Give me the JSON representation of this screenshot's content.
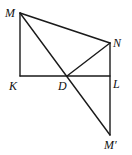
{
  "diagram": {
    "type": "geometry",
    "stroke_color": "#1a1a1a",
    "points": {
      "M": {
        "label": "M",
        "x": 20,
        "y": 13
      },
      "N": {
        "label": "N",
        "x": 110,
        "y": 43
      },
      "K": {
        "label": "K",
        "x": 20,
        "y": 76
      },
      "D": {
        "label": "D",
        "x": 67,
        "y": 76
      },
      "L": {
        "label": "L",
        "x": 110,
        "y": 76
      },
      "Mp": {
        "label": "M′",
        "x": 110,
        "y": 135
      }
    },
    "segments": [
      [
        "M",
        "K"
      ],
      [
        "K",
        "L"
      ],
      [
        "M",
        "N"
      ],
      [
        "N",
        "Mp"
      ],
      [
        "M",
        "Mp"
      ],
      [
        "N",
        "D"
      ]
    ]
  }
}
